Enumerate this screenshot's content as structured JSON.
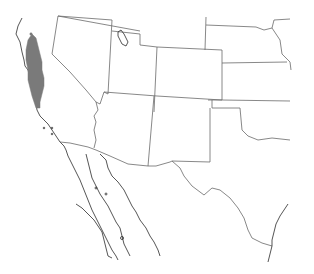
{
  "map": {
    "type": "species range map",
    "region": "Southwestern United States and northern Mexico",
    "colors": {
      "background": "#ffffff",
      "state_borders": "#6a6a6a",
      "coastline": "#2a2a2a",
      "range_fill": "#7a7a7a"
    },
    "range_area": "Central and northern California (Coast Ranges / Sierra foothills)",
    "labels": []
  }
}
